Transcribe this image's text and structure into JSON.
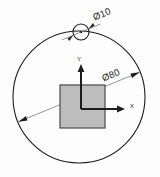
{
  "drawing": {
    "title": "Bolt circle layout detail",
    "background_color": "#fdfdfd",
    "line_color": "#1d1d1d",
    "thin_line_color": "#6f6f6f",
    "square_fill": "#bdbdbd",
    "square_stroke": "#4a4a4a",
    "dimensions": [
      {
        "id": "hole-diameter",
        "label": "Ø10",
        "value": 10,
        "symbol": "Ø",
        "rotation_deg": -22,
        "text_x": 103,
        "text_y": 17
      },
      {
        "id": "bolt-circle-diameter",
        "label": "Ø80",
        "value": 80,
        "symbol": "Ø",
        "rotation_deg": -22,
        "text_x": 112,
        "text_y": 78
      }
    ],
    "axes": [
      {
        "id": "y-axis",
        "label": "Y",
        "text_x": 79,
        "text_y": 61
      },
      {
        "id": "x-axis",
        "label": "X",
        "text_x": 130,
        "text_y": 108
      }
    ],
    "geometry": {
      "bolt_circle": {
        "cx": 79,
        "cy": 97,
        "r": 66
      },
      "hole_circle": {
        "cx": 81,
        "cy": 32,
        "r": 8
      },
      "square": {
        "x": 60,
        "y": 85,
        "width": 45,
        "height": 43
      },
      "origin": {
        "x": 81,
        "y": 109
      }
    }
  }
}
